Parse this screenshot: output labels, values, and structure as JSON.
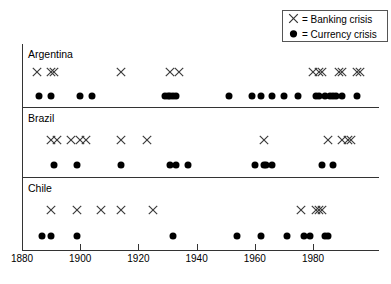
{
  "legend": {
    "items": [
      {
        "symbol": "x-marker-icon",
        "glyph": "✕",
        "text": "= Banking crisis"
      },
      {
        "symbol": "dot-marker-icon",
        "glyph": "●",
        "text": "= Currency crisis"
      }
    ]
  },
  "chart_data": {
    "type": "scatter",
    "title": "",
    "xlabel": "",
    "ylabel": "",
    "xlim": [
      1880,
      1998
    ],
    "grid": false,
    "legend_position": "top-right",
    "xticks": [
      1880,
      1900,
      1920,
      1940,
      1960,
      1980
    ],
    "xticklabels": [
      "1880",
      "1900",
      "1920",
      "1940",
      "1960",
      "1980"
    ],
    "legend_entries": [
      "X = Banking crisis",
      "= Currency crisis"
    ],
    "panels": [
      {
        "name": "Argentina",
        "series": [
          {
            "name": "Banking crisis",
            "marker": "x",
            "years": [
              1885,
              1890,
              1891,
              1914,
              1931,
              1934,
              1980,
              1982,
              1983,
              1989,
              1990,
              1995,
              1996
            ]
          },
          {
            "name": "Currency crisis",
            "marker": "dot",
            "years": [
              1886,
              1890,
              1900,
              1904,
              1929,
              1930,
              1931,
              1932,
              1933,
              1951,
              1959,
              1962,
              1966,
              1970,
              1975,
              1981,
              1982,
              1984,
              1986,
              1987,
              1988,
              1990,
              1995
            ]
          }
        ]
      },
      {
        "name": "Brazil",
        "series": [
          {
            "name": "Banking crisis",
            "marker": "x",
            "years": [
              1890,
              1892,
              1897,
              1900,
              1902,
              1914,
              1923,
              1963,
              1985,
              1990,
              1992,
              1993
            ]
          },
          {
            "name": "Currency crisis",
            "marker": "dot",
            "years": [
              1891,
              1899,
              1914,
              1931,
              1933,
              1937,
              1960,
              1963,
              1964,
              1966,
              1983,
              1987
            ]
          }
        ]
      },
      {
        "name": "Chile",
        "series": [
          {
            "name": "Banking crisis",
            "marker": "x",
            "years": [
              1890,
              1899,
              1907,
              1914,
              1925,
              1976,
              1981,
              1982,
              1983
            ]
          },
          {
            "name": "Currency crisis",
            "marker": "dot",
            "years": [
              1887,
              1890,
              1899,
              1932,
              1954,
              1962,
              1971,
              1977,
              1979,
              1984,
              1985
            ]
          }
        ]
      }
    ]
  }
}
